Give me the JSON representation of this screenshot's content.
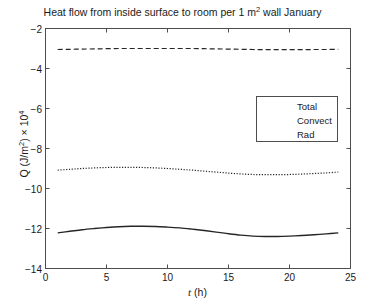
{
  "chart_data": {
    "type": "line",
    "title": "Heat flow from inside surface to room per 1 m2 wall January",
    "title_parts": {
      "before_sup": "Heat flow from inside surface to room per 1 m",
      "sup": "2",
      "after_sup": " wall January"
    },
    "xlabel": "t (h)",
    "xlabel_parts": {
      "symbol": "t",
      "unit": " (h)"
    },
    "ylabel": "Q (J/m2) x 104",
    "ylabel_parts": {
      "lead": "Q (J/m",
      "sup1": "2",
      "mid": ") × 10",
      "sup2": "4"
    },
    "xlim": [
      0,
      25
    ],
    "ylim": [
      -14,
      -2
    ],
    "xticks": [
      0,
      5,
      10,
      15,
      20,
      25
    ],
    "xtick_labels": [
      "0",
      "5",
      "10",
      "15",
      "20",
      "25"
    ],
    "yticks": [
      -2,
      -4,
      -6,
      -8,
      -10,
      -12,
      -14
    ],
    "ytick_labels": [
      "−2",
      "−4",
      "−6",
      "−8",
      "−10",
      "−12",
      "−14"
    ],
    "grid": false,
    "legend_position": "center-right",
    "legend_entries": [
      "Total",
      "Convect",
      "Rad"
    ],
    "x": [
      1,
      2,
      3,
      4,
      5,
      6,
      7,
      8,
      9,
      10,
      11,
      12,
      13,
      14,
      15,
      16,
      17,
      18,
      19,
      20,
      21,
      22,
      23,
      24
    ],
    "series": [
      {
        "name": "Total",
        "style": "solid",
        "color": "#262626",
        "values": [
          -12.22,
          -12.14,
          -12.06,
          -12.0,
          -11.95,
          -11.91,
          -11.89,
          -11.89,
          -11.9,
          -11.93,
          -11.97,
          -12.03,
          -12.1,
          -12.18,
          -12.26,
          -12.33,
          -12.38,
          -12.4,
          -12.4,
          -12.38,
          -12.35,
          -12.31,
          -12.27,
          -12.22
        ]
      },
      {
        "name": "Convect",
        "style": "dashed",
        "color": "#262626",
        "values": [
          -3.05,
          -3.04,
          -3.03,
          -3.02,
          -3.01,
          -3.0,
          -3.0,
          -3.0,
          -3.0,
          -3.0,
          -3.0,
          -3.0,
          -3.01,
          -3.02,
          -3.03,
          -3.04,
          -3.05,
          -3.06,
          -3.06,
          -3.06,
          -3.06,
          -3.05,
          -3.05,
          -3.04
        ]
      },
      {
        "name": "Rad",
        "style": "dotted",
        "color": "#262626",
        "values": [
          -9.08,
          -9.04,
          -9.0,
          -8.97,
          -8.95,
          -8.94,
          -8.94,
          -8.95,
          -8.97,
          -9.0,
          -9.04,
          -9.08,
          -9.13,
          -9.18,
          -9.23,
          -9.27,
          -9.3,
          -9.31,
          -9.31,
          -9.3,
          -9.28,
          -9.25,
          -9.22,
          -9.18
        ]
      }
    ]
  },
  "axes": {
    "frame_color": "#4d4d4d"
  }
}
